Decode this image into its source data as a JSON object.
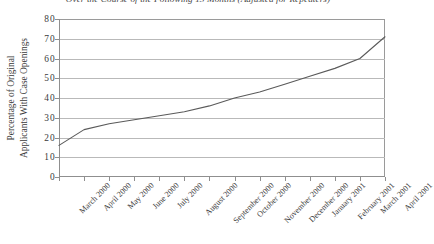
{
  "chart_data": {
    "type": "line",
    "title": "Over the Course of the Following 13 Months (Adjusted for Repeaters)",
    "xlabel": "",
    "ylabel_line1": "Percentage of Original",
    "ylabel_line2": "Applicants With Case Openings",
    "ylim": [
      0,
      80
    ],
    "ytick_values": [
      80,
      70,
      60,
      50,
      40,
      30,
      20,
      10,
      0
    ],
    "ytick_labels": [
      "80",
      "70",
      "60",
      "50",
      "40",
      "30",
      "20",
      "10",
      "0"
    ],
    "grid": true,
    "legend": "none",
    "categories": [
      "March 2000",
      "April 2000",
      "May 2000",
      "June 2000",
      "July 2000",
      "August 2000",
      "September 2000",
      "October 2000",
      "November 2000",
      "December 2000",
      "January 2001",
      "February 2001",
      "March 2001",
      "April 2001"
    ],
    "values": [
      16,
      24,
      27,
      29,
      31,
      33,
      36,
      40,
      43,
      47,
      51,
      55,
      60,
      71
    ],
    "series": [
      {
        "name": "Percentage of Original Applicants With Case Openings",
        "color": "#5a5a5a",
        "values": [
          16,
          24,
          27,
          29,
          31,
          33,
          36,
          40,
          43,
          47,
          51,
          55,
          60,
          71
        ]
      }
    ]
  },
  "colors": {
    "line": "#5a5a5a",
    "grid": "#b9b9b9",
    "axis": "#8f8f8f",
    "frame": "#9a9a9a",
    "text": "#3a3a3a",
    "background": "#ffffff"
  }
}
